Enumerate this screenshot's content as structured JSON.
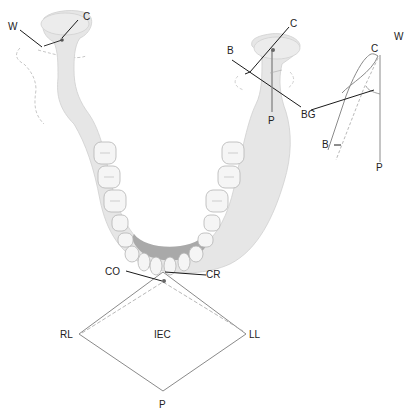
{
  "diagram": {
    "colors": {
      "bone": "#e6e6e6",
      "bone_edge": "#c8c8c8",
      "tooth": "#f4f4f4",
      "tooth_edge": "#b4b4b4",
      "floor": "#a8a8a8",
      "line": "#1a1a1a",
      "trace": "#8a8a8a",
      "dashed": "#b0b0b0"
    },
    "left_condyle_labels": {
      "w": "W",
      "c": "C"
    },
    "right_condyle_labels": {
      "c": "C",
      "b": "B",
      "p": "P",
      "bg": "BG"
    },
    "sagittal_trace_labels": {
      "c": "C",
      "w": "W",
      "b": "B",
      "p": "P"
    },
    "horizontal_envelope_labels": {
      "co": "CO",
      "cr": "CR",
      "rl": "RL",
      "ll": "LL",
      "center": "IEC",
      "p": "P"
    }
  }
}
